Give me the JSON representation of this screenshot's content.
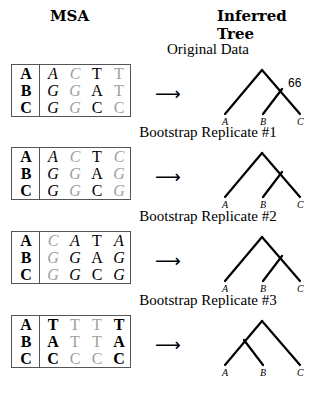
{
  "headers": {
    "msa": "MSA",
    "tree": "Inferred Tree"
  },
  "arrow": "⟶",
  "blocks": [
    {
      "caption": "Original Data",
      "rows": [
        {
          "label": "A",
          "cells": [
            "A",
            "C",
            "T",
            "T"
          ]
        },
        {
          "label": "B",
          "cells": [
            "G",
            "G",
            "A",
            "T"
          ]
        },
        {
          "label": "C",
          "cells": [
            "G",
            "G",
            "C",
            "C"
          ]
        }
      ],
      "column_styles": [
        {
          "italic": true,
          "gray": false
        },
        {
          "italic": true,
          "gray": true
        },
        {
          "italic": false,
          "gray": false
        },
        {
          "italic": false,
          "gray": true
        }
      ],
      "tree": {
        "topology": "(A,(B,C))",
        "support": "66",
        "leaves": [
          "A",
          "B",
          "C"
        ]
      }
    },
    {
      "caption": "Bootstrap Replicate #1",
      "rows": [
        {
          "label": "A",
          "cells": [
            "A",
            "C",
            "T",
            "C"
          ]
        },
        {
          "label": "B",
          "cells": [
            "G",
            "G",
            "A",
            "G"
          ]
        },
        {
          "label": "C",
          "cells": [
            "G",
            "G",
            "C",
            "G"
          ]
        }
      ],
      "column_styles": [
        {
          "italic": true,
          "gray": false
        },
        {
          "italic": true,
          "gray": true
        },
        {
          "italic": false,
          "gray": false
        },
        {
          "italic": true,
          "gray": true
        }
      ],
      "tree": {
        "topology": "(A,(B,C))",
        "support": "",
        "leaves": [
          "A",
          "B",
          "C"
        ]
      }
    },
    {
      "caption": "Bootstrap Replicate #2",
      "rows": [
        {
          "label": "A",
          "cells": [
            "C",
            "A",
            "T",
            "A"
          ]
        },
        {
          "label": "B",
          "cells": [
            "G",
            "G",
            "A",
            "G"
          ]
        },
        {
          "label": "C",
          "cells": [
            "G",
            "G",
            "C",
            "G"
          ]
        }
      ],
      "column_styles": [
        {
          "italic": true,
          "gray": true
        },
        {
          "italic": true,
          "gray": false
        },
        {
          "italic": false,
          "gray": false
        },
        {
          "italic": true,
          "gray": false
        }
      ],
      "tree": {
        "topology": "(A,(B,C))",
        "support": "",
        "leaves": [
          "A",
          "B",
          "C"
        ]
      }
    },
    {
      "caption": "Bootstrap Replicate #3",
      "rows": [
        {
          "label": "A",
          "cells": [
            "T",
            "T",
            "T",
            "T"
          ]
        },
        {
          "label": "B",
          "cells": [
            "A",
            "T",
            "T",
            "A"
          ]
        },
        {
          "label": "C",
          "cells": [
            "C",
            "C",
            "C",
            "C"
          ]
        }
      ],
      "column_styles": [
        {
          "italic": false,
          "gray": false,
          "bold": true
        },
        {
          "italic": false,
          "gray": true
        },
        {
          "italic": false,
          "gray": true
        },
        {
          "italic": false,
          "gray": false,
          "bold": true
        }
      ],
      "tree": {
        "topology": "((A,B),C)",
        "support": "",
        "leaves": [
          "A",
          "B",
          "C"
        ]
      }
    }
  ]
}
